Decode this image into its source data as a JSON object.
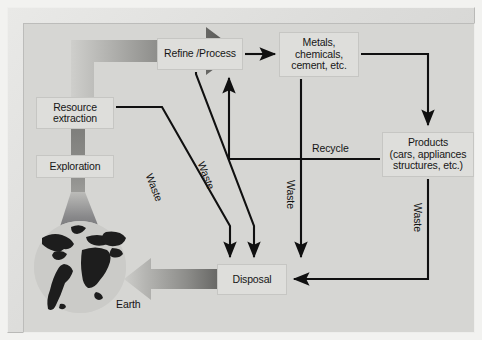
{
  "figure": {
    "background_color": "#d6d6d3",
    "frame_color": "#dcdcda",
    "box_fill": "#dededb",
    "line_color": "#101010"
  },
  "nodes": [
    {
      "id": "refine",
      "label": "Refine /Process"
    },
    {
      "id": "metals",
      "label": "Metals,\nchemicals,\ncement, etc."
    },
    {
      "id": "products",
      "label": "Products\n(cars, appliances\nstructures, etc.)"
    },
    {
      "id": "resource",
      "label": "Resource\nextraction"
    },
    {
      "id": "exploration",
      "label": "Exploration"
    },
    {
      "id": "disposal",
      "label": "Disposal"
    }
  ],
  "node_labels": {
    "refine": "Refine /Process",
    "metals_line1": "Metals,",
    "metals_line2": "chemicals,",
    "metals_line3": "cement, etc.",
    "products_line1": "Products",
    "products_line2": "(cars, appliances",
    "products_line3": "structures, etc.)",
    "resource_line1": "Resource",
    "resource_line2": "extraction",
    "exploration": "Exploration",
    "disposal": "Disposal"
  },
  "edge_labels": {
    "recycle": "Recycle",
    "waste_1": "Waste",
    "waste_2": "Waste",
    "waste_3": "Waste",
    "waste_4": "Waste"
  },
  "annotations": {
    "earth": "Earth"
  },
  "flows": [
    {
      "from": "earth",
      "to": "refine",
      "label": "",
      "style": "thick-gradient-arrow"
    },
    {
      "from": "refine",
      "to": "metals",
      "label": "",
      "style": "arrow"
    },
    {
      "from": "metals",
      "to": "products",
      "label": "",
      "style": "arrow"
    },
    {
      "from": "products",
      "to": "refine",
      "label": "Recycle",
      "style": "arrow"
    },
    {
      "from": "products",
      "to": "disposal",
      "label": "Waste",
      "style": "arrow"
    },
    {
      "from": "metals",
      "to": "disposal",
      "label": "Waste",
      "style": "arrow"
    },
    {
      "from": "refine",
      "to": "disposal",
      "label": "Waste",
      "style": "arrow"
    },
    {
      "from": "resource",
      "to": "disposal",
      "label": "Waste",
      "style": "arrow"
    },
    {
      "from": "disposal",
      "to": "earth",
      "label": "",
      "style": "thick-gradient-arrow"
    },
    {
      "from": "exploration",
      "to": "resource",
      "label": "",
      "style": "gradient-band"
    }
  ]
}
